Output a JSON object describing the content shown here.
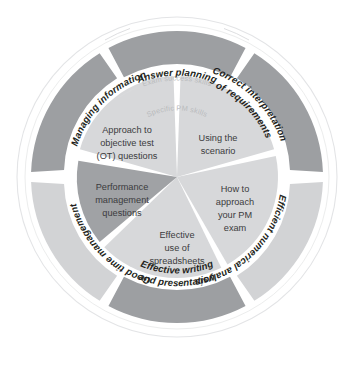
{
  "diagram": {
    "type": "concentric-wheel",
    "background_color": "#ffffff",
    "outline_color": "#e3e4e6",
    "colors": {
      "outer_dark": "#9d9fa2",
      "outer_light": "#d2d3d5",
      "inner_light": "#d7d8da",
      "inner_dark": "#a0a2a5",
      "divider": "#ffffff",
      "outer_label_text": "#231f20",
      "inner_label_text": "#3b3b3d",
      "caption_text": "#b9bbbd"
    },
    "captions": {
      "outer_ring": "Exam success skills",
      "inner_ring": "Specific PM skills"
    },
    "outer_ring": {
      "caption": "Exam success skills",
      "segments": [
        {
          "id": "answer-planning",
          "label": "Answer planning",
          "lines": [
            "Answer planning"
          ],
          "shade": "dark",
          "position": "top"
        },
        {
          "id": "correct-interpretation-of-requirements",
          "label": "Correct interpretation of requirements",
          "lines": [
            "Correct interpretation",
            "of requirements"
          ],
          "shade": "dark",
          "position": "upper-right"
        },
        {
          "id": "efficient-numerical-analysis",
          "label": "Efficient numerical analysis",
          "lines": [
            "Efficient numerical analysis"
          ],
          "shade": "light",
          "position": "lower-right"
        },
        {
          "id": "effective-writing-and-presentation",
          "label": "Effective writing and presentation",
          "lines": [
            "Effective writing",
            "and presentation"
          ],
          "shade": "dark",
          "position": "bottom"
        },
        {
          "id": "good-time-management",
          "label": "Good time management",
          "lines": [
            "Good time management"
          ],
          "shade": "light",
          "position": "lower-left"
        },
        {
          "id": "managing-information",
          "label": "Managing information",
          "lines": [
            "Managing information"
          ],
          "shade": "dark",
          "position": "upper-left"
        }
      ]
    },
    "inner_ring": {
      "caption": "Specific PM skills",
      "segments": [
        {
          "id": "using-the-scenario",
          "label": "Using the scenario",
          "lines": [
            "Using the",
            "scenario"
          ],
          "shade": "light",
          "position": "upper-right"
        },
        {
          "id": "how-to-approach-your-pm-exam",
          "label": "How to approach your PM exam",
          "lines": [
            "How to",
            "approach",
            "your PM",
            "exam"
          ],
          "shade": "light",
          "position": "right"
        },
        {
          "id": "effective-use-of-spreadsheets",
          "label": "Effective use of spreadsheets",
          "lines": [
            "Effective",
            "use of",
            "spreadsheets"
          ],
          "shade": "light",
          "position": "bottom"
        },
        {
          "id": "performance-management-questions",
          "label": "Performance management questions",
          "lines": [
            "Performance",
            "management",
            "questions"
          ],
          "shade": "dark",
          "position": "left"
        },
        {
          "id": "approach-to-objective-test-ot-questions",
          "label": "Approach to objective test (OT) questions",
          "lines": [
            "Approach to",
            "objective test",
            "(OT) questions"
          ],
          "shade": "light",
          "position": "upper-left"
        }
      ]
    }
  }
}
